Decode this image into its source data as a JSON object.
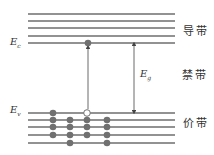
{
  "labels": {
    "conduction_band": "导带",
    "forbidden_band": "禁带",
    "valence_band": "价带",
    "Ec_main": "E",
    "Ec_sub": "c",
    "Ev_main": "E",
    "Ev_sub": "v",
    "Eg_main": "E",
    "Eg_sub": "g"
  },
  "colors": {
    "line": "#6e6e6e",
    "electron": "#707070",
    "hole_fill": "#ffffff",
    "hole_stroke": "#707070",
    "arrow": "#444444"
  },
  "conduction_lines_y": [
    14,
    21,
    28,
    36,
    43
  ],
  "valence_lines_y": [
    113,
    120,
    127,
    135,
    143
  ],
  "line_x_range": [
    28,
    175
  ],
  "excited_electron": {
    "x": 88,
    "y": 43
  },
  "hole": {
    "x": 87,
    "y": 113
  },
  "valence_electron_columns": [
    {
      "x": 53,
      "lines": [
        0,
        1,
        2,
        3
      ]
    },
    {
      "x": 70,
      "lines": [
        1,
        2,
        3,
        4
      ]
    },
    {
      "x": 87,
      "lines": [
        1,
        2,
        3
      ]
    },
    {
      "x": 107,
      "lines": [
        1,
        2,
        3,
        4
      ]
    }
  ],
  "gap_arrow": {
    "x": 134,
    "y_top": 43,
    "y_bottom": 113
  }
}
